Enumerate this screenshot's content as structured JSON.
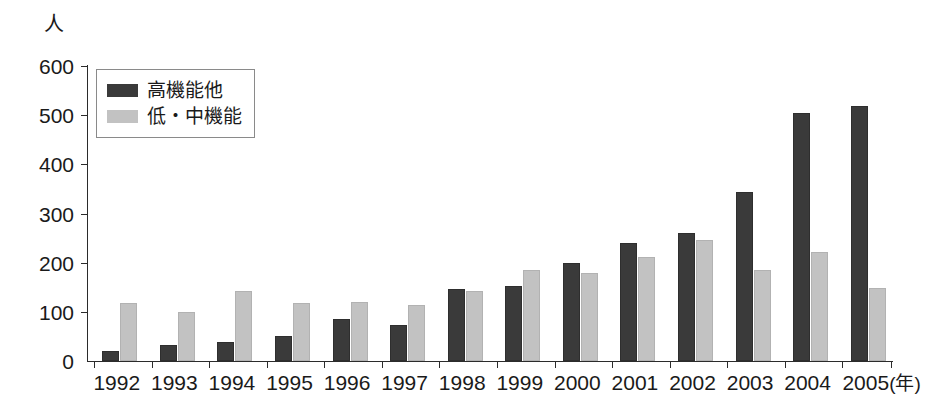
{
  "chart_data": {
    "type": "bar",
    "title": "",
    "subtitle": "",
    "xlabel": "(年)",
    "ylabel": "人",
    "ylim": [
      0,
      600
    ],
    "ytick_step": 100,
    "yticks": [
      "0",
      "100",
      "200",
      "300",
      "400",
      "500",
      "600"
    ],
    "grid": false,
    "legend_position": "top-left",
    "categories": [
      "1992",
      "1993",
      "1994",
      "1995",
      "1996",
      "1997",
      "1998",
      "1999",
      "2000",
      "2001",
      "2002",
      "2003",
      "2004",
      "2005"
    ],
    "series": [
      {
        "name": "高機能他",
        "color": "#3a3a3a",
        "values": [
          20,
          33,
          38,
          50,
          85,
          74,
          147,
          152,
          200,
          240,
          261,
          343,
          505,
          518
        ]
      },
      {
        "name": "低・中機能",
        "color": "#c2c2c2",
        "values": [
          117,
          99,
          142,
          118,
          121,
          113,
          143,
          185,
          178,
          211,
          247,
          185,
          221,
          149
        ]
      }
    ]
  },
  "axes": {
    "y_unit_label": "人",
    "x_unit_label": "(年)"
  },
  "legend": {
    "items": [
      {
        "label": "高機能他",
        "swatch": "dark-square-swatch"
      },
      {
        "label": "低・中機能",
        "swatch": "light-square-swatch"
      }
    ]
  }
}
